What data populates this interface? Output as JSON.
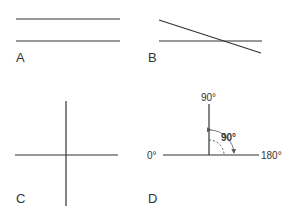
{
  "panels": {
    "A": {
      "label": "A",
      "description": "parallel lines"
    },
    "B": {
      "label": "B",
      "description": "intersecting lines"
    },
    "C": {
      "label": "C",
      "description": "perpendicular lines"
    },
    "D": {
      "label": "D",
      "description": "right angle",
      "top_label": "90°",
      "left_label": "0°",
      "right_label": "180°",
      "angle_label": "90°"
    }
  },
  "colors": {
    "line": "#333333",
    "background": "#ffffff"
  }
}
